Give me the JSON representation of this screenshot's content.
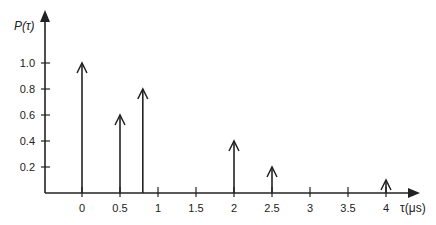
{
  "chart_data": {
    "type": "stem",
    "title": "",
    "ylabel": "P(τ)",
    "xlabel": "τ(μs)",
    "x_ticks": [
      0,
      0.5,
      1,
      1.5,
      2,
      2.5,
      3,
      3.5,
      4
    ],
    "x_tick_labels": [
      "0",
      "0.5",
      "1",
      "1.5",
      "2",
      "2.5",
      "3",
      "3.5",
      "4"
    ],
    "y_ticks": [
      0.2,
      0.4,
      0.6,
      0.8,
      1.0
    ],
    "y_tick_labels": [
      "0.2",
      "0.4",
      "0.6",
      "0.8",
      "1.0"
    ],
    "xlim": [
      -0.5,
      4.5
    ],
    "ylim": [
      0,
      1.4
    ],
    "grid": false,
    "legend": null,
    "marker": "open-arrowhead (impulse)",
    "x": [
      0,
      0.5,
      0.8,
      2,
      2.5,
      4
    ],
    "values": [
      1.0,
      0.6,
      0.8,
      0.4,
      0.2,
      0.1
    ]
  },
  "colors": {
    "axis": "#222222",
    "stem": "#222222",
    "text": "#222222"
  }
}
